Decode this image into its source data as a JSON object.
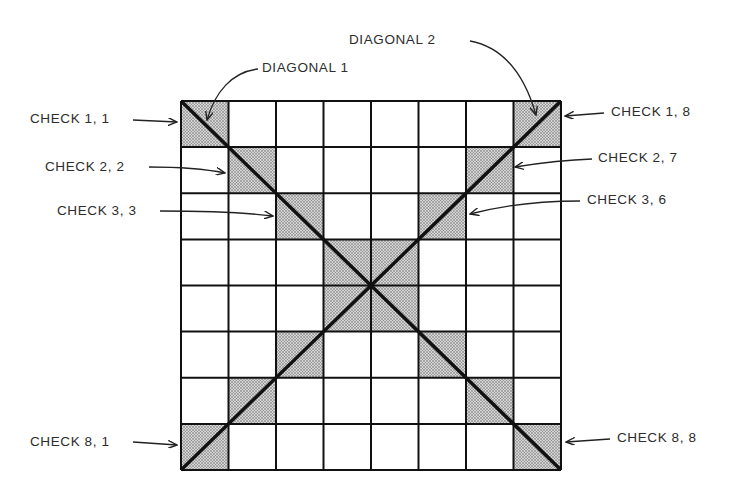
{
  "diagram": {
    "title": "",
    "grid": {
      "rows": 8,
      "cols": 8,
      "left": 181,
      "top": 101,
      "right": 561,
      "bottom": 470
    },
    "shade_color": "#bdbdbd",
    "line_color": "#111111",
    "labels": {
      "diagonal_1": "DIAGONAL 1",
      "diagonal_2": "DIAGONAL 2",
      "check_1_1": "CHECK 1, 1",
      "check_2_2": "CHECK 2, 2",
      "check_3_3": "CHECK 3, 3",
      "check_8_1": "CHECK 8, 1",
      "check_1_8": "CHECK 1, 8",
      "check_2_7": "CHECK 2, 7",
      "check_3_6": "CHECK 3, 6",
      "check_8_8": "CHECK 8, 8"
    }
  }
}
